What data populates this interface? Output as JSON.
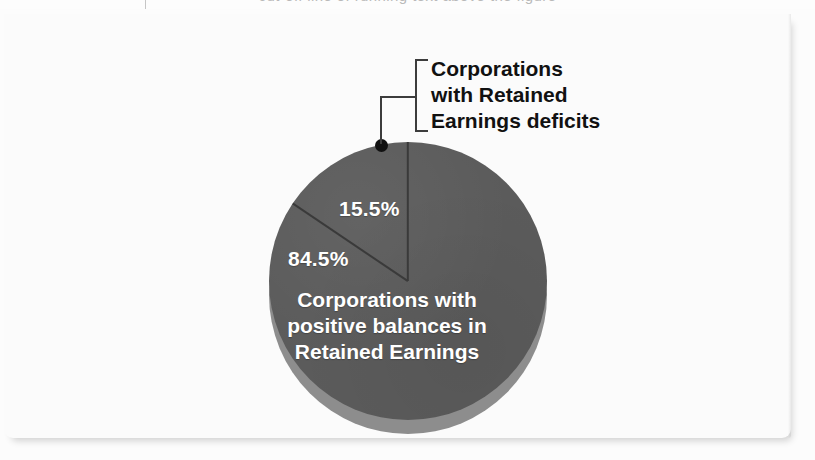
{
  "top_sliver": {
    "text": "cut-off line of running text above the figure"
  },
  "figure": {
    "callout": {
      "line1": "Corporations",
      "line2": "with Retained",
      "line3": "Earnings deficits"
    },
    "inner_label": {
      "line1": "Corporations with",
      "line2": "positive balances in",
      "line3": "Retained Earnings"
    },
    "pct_small": "15.5%",
    "pct_large": "84.5%"
  },
  "colors": {
    "pie_face": "#5b5b5b",
    "pie_depth": "#8d8d8d",
    "divider": "#3a3a3a",
    "label_text": "#ffffff",
    "callout_text": "#111111",
    "card_background": "#fbfbfb"
  },
  "chart_data": {
    "type": "pie",
    "title": "",
    "labels": [
      "Corporations with positive balances in Retained Earnings",
      "Corporations with Retained Earnings deficits"
    ],
    "values": [
      84.5,
      15.5
    ],
    "value_labels": [
      "84.5%",
      "15.5%"
    ],
    "units": "percent",
    "total": 100,
    "colors": [
      "#5b5b5b",
      "#5b5b5b"
    ],
    "start_angle_deg": 0,
    "direction": "counterclockwise",
    "legend": "none",
    "grid": false,
    "annotations": [
      {
        "text": "Corporations with Retained Earnings deficits",
        "target_slice": "Corporations with Retained Earnings deficits",
        "style": "bracketed-callout-with-leader-dot"
      },
      {
        "text": "Corporations with positive balances in Retained Earnings",
        "target_slice": "Corporations with positive balances in Retained Earnings",
        "style": "inside-slice"
      }
    ],
    "style": {
      "three_d": true,
      "depth_shading": true
    }
  }
}
